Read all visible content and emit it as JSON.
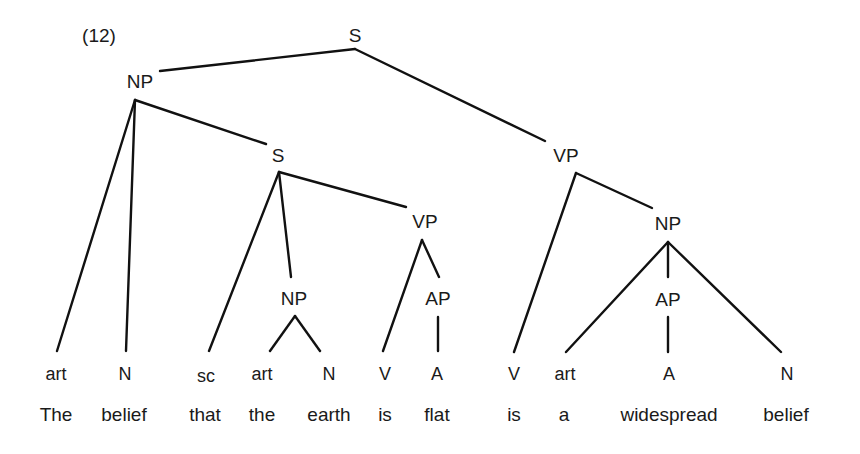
{
  "example": {
    "number": "(12)"
  },
  "tree": {
    "nodes": {
      "root_s": "S",
      "subject_np": "NP",
      "embedded_s": "S",
      "main_vp": "VP",
      "embedded_vp": "VP",
      "predicate_np": "NP",
      "embedded_np": "NP",
      "embedded_ap": "AP",
      "predicate_ap": "AP"
    },
    "terminals": [
      {
        "category": "art",
        "word": "The"
      },
      {
        "category": "N",
        "word": "belief"
      },
      {
        "category": "sc",
        "word": "that"
      },
      {
        "category": "art",
        "word": "the"
      },
      {
        "category": "N",
        "word": "earth"
      },
      {
        "category": "V",
        "word": "is"
      },
      {
        "category": "A",
        "word": "flat"
      },
      {
        "category": "V",
        "word": "is"
      },
      {
        "category": "art",
        "word": "a"
      },
      {
        "category": "A",
        "word": "widespread"
      },
      {
        "category": "N",
        "word": "belief"
      }
    ],
    "sentence": "The belief that the earth is flat is a widespread belief",
    "colors": {
      "ink": "#111111",
      "background": "#ffffff"
    }
  }
}
